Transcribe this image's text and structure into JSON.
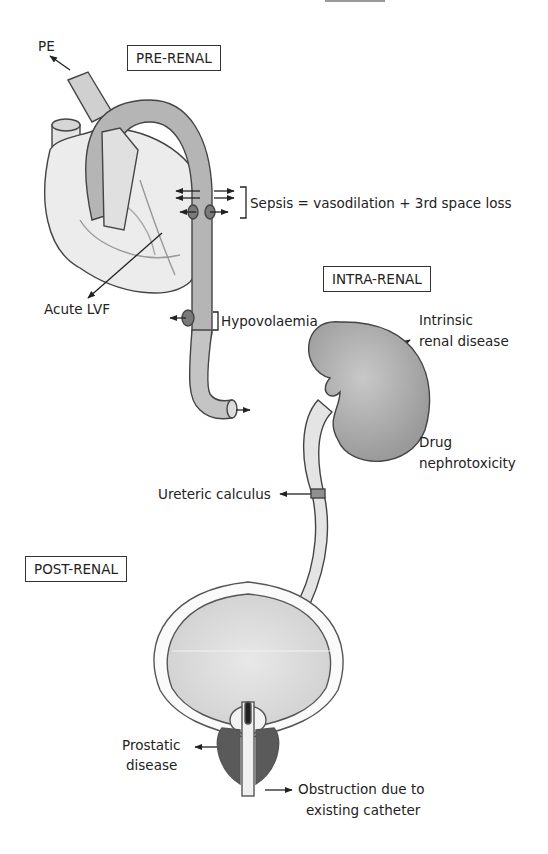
{
  "diagram": {
    "type": "medical-illustration",
    "sections": [
      {
        "id": "pre-renal",
        "title": "PRE-RENAL"
      },
      {
        "id": "intra-renal",
        "title": "INTRA-RENAL"
      },
      {
        "id": "post-renal",
        "title": "POST-RENAL"
      }
    ],
    "labels": {
      "pe": "PE",
      "sepsis": "Sepsis = vasodilation + 3rd space loss",
      "acute_lvf": "Acute LVF",
      "hypovolaemia": "Hypovolaemia",
      "intrinsic_1": "Intrinsic",
      "intrinsic_2": "renal disease",
      "drug_1": "Drug",
      "drug_2": "nephrotoxicity",
      "ureteric": "Ureteric calculus",
      "prostatic_1": "Prostatic",
      "prostatic_2": "disease",
      "obstruction_1": "Obstruction due to",
      "obstruction_2": "existing catheter"
    },
    "colors": {
      "line": "#333333",
      "light_fill": "#e6e6e6",
      "mid_fill": "#bdbdbd",
      "dark_fill": "#8a8a8a",
      "kidney_fill": "#a9a9a9",
      "bladder_fill": "#d9d9d9"
    }
  }
}
